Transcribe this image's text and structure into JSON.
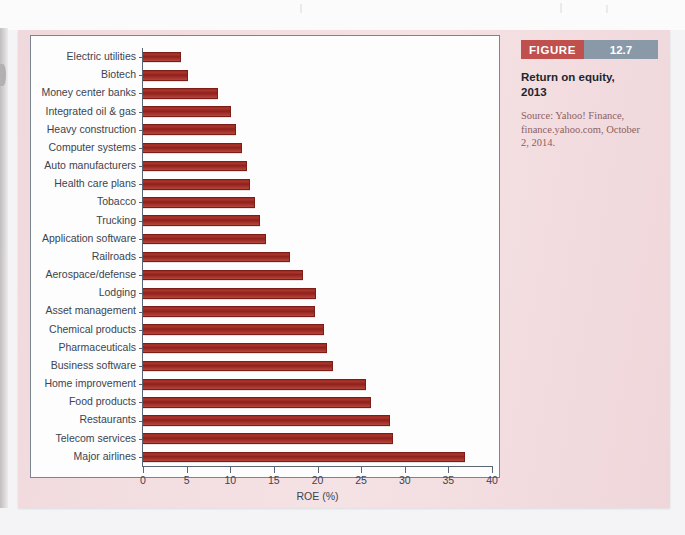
{
  "figure": {
    "tag_label": "FIGURE",
    "tag_number": "12.7",
    "title": "Return on equity, 2013",
    "source": "Source: Yahoo! Finance, finance.yahoo.com, October 2, 2014.",
    "accent_tag_color": "#c0504d",
    "accent_number_color": "#8a99a8",
    "panel_color": "#f3dde0",
    "bar_color": "#9e2b23"
  },
  "chart_data": {
    "type": "bar",
    "orientation": "horizontal",
    "title": "Return on equity, 2013",
    "subtitle": "",
    "xlabel": "ROE (%)",
    "ylabel": "",
    "xlim": [
      0,
      40
    ],
    "xticks": [
      0,
      5,
      10,
      15,
      20,
      25,
      30,
      35,
      40
    ],
    "xtick_labels": [
      "0",
      "5",
      "10",
      "15",
      "20",
      "25",
      "30",
      "35",
      "40"
    ],
    "grid": false,
    "legend": false,
    "legend_position": "none",
    "categories": [
      "Electric utilities",
      "Biotech",
      "Money center banks",
      "Integrated oil & gas",
      "Heavy construction",
      "Computer systems",
      "Auto manufacturers",
      "Health care plans",
      "Tobacco",
      "Trucking",
      "Application software",
      "Railroads",
      "Aerospace/defense",
      "Lodging",
      "Asset management",
      "Chemical products",
      "Pharmaceuticals",
      "Business software",
      "Home improvement",
      "Food products",
      "Restaurants",
      "Telecom services",
      "Major airlines"
    ],
    "values": [
      4.4,
      5.2,
      8.6,
      10.1,
      10.7,
      11.3,
      11.9,
      12.3,
      12.8,
      13.4,
      14.1,
      16.8,
      18.3,
      19.8,
      19.7,
      20.8,
      21.1,
      21.8,
      25.6,
      26.1,
      28.3,
      28.6,
      36.9
    ],
    "series": [
      {
        "name": "ROE (%)",
        "values": [
          4.4,
          5.2,
          8.6,
          10.1,
          10.7,
          11.3,
          11.9,
          12.3,
          12.8,
          13.4,
          14.1,
          16.8,
          18.3,
          19.8,
          19.7,
          20.8,
          21.1,
          21.8,
          25.6,
          26.1,
          28.3,
          28.6,
          36.9
        ]
      }
    ]
  }
}
